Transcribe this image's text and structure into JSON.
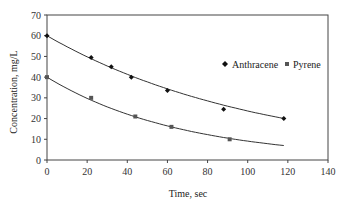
{
  "chart_data": {
    "type": "scatter",
    "title": "",
    "xlabel": "Time, sec",
    "ylabel": "Concentration, mg/L",
    "xlim": [
      0,
      140
    ],
    "ylim": [
      0,
      70
    ],
    "xticks": [
      0,
      20,
      40,
      60,
      80,
      100,
      120,
      140
    ],
    "yticks": [
      0,
      10,
      20,
      30,
      40,
      50,
      60,
      70
    ],
    "grid": false,
    "legend_position": "upper right inside",
    "series": [
      {
        "name": "Anthracene",
        "marker": "diamond",
        "color": "#111111",
        "points": [
          [
            0,
            60
          ],
          [
            22,
            49.5
          ],
          [
            32,
            45
          ],
          [
            42,
            40
          ],
          [
            60,
            33.5
          ],
          [
            88,
            24.5
          ],
          [
            118,
            20
          ]
        ],
        "fit": {
          "type": "exponential",
          "C0": 60,
          "k": 0.0093,
          "x_range": [
            0,
            118
          ]
        }
      },
      {
        "name": "Pyrene",
        "marker": "square",
        "color": "#555555",
        "points": [
          [
            0,
            40
          ],
          [
            22,
            30
          ],
          [
            44,
            21
          ],
          [
            62,
            16
          ],
          [
            91,
            10
          ]
        ],
        "fit": {
          "type": "exponential",
          "C0": 40,
          "k": 0.0148,
          "x_range": [
            0,
            118
          ]
        }
      }
    ]
  },
  "axes": {
    "x_title": "Time, sec",
    "y_title": "Concentration, mg/L",
    "x_tick_labels": [
      "0",
      "20",
      "40",
      "60",
      "80",
      "100",
      "120",
      "140"
    ],
    "y_tick_labels": [
      "0",
      "10",
      "20",
      "30",
      "40",
      "50",
      "60",
      "70"
    ]
  },
  "legend": {
    "items": [
      {
        "label": "Anthracene",
        "marker": "diamond"
      },
      {
        "label": "Pyrene",
        "marker": "square"
      }
    ]
  }
}
